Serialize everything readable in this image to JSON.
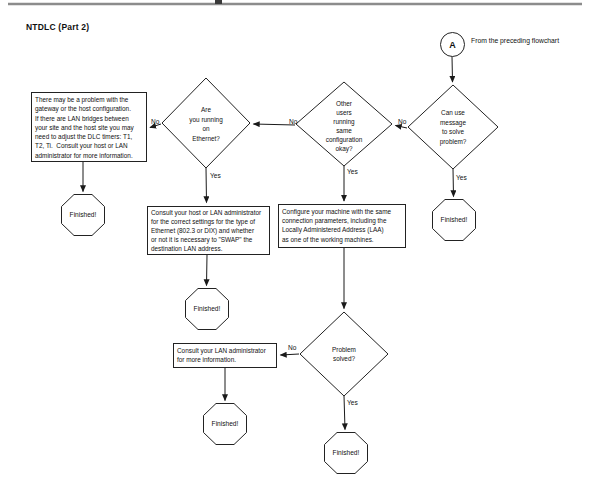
{
  "title": "NTDLC (Part 2)",
  "start": {
    "label": "A",
    "caption": "From the preceding flowchart"
  },
  "decisions": {
    "ethernet": {
      "text": "Are\nyou running\non\nEthernet?",
      "yes": "Yes",
      "no": "No"
    },
    "other_users": {
      "text": "Other\nusers\nrunning\nsame\nconfiguration\nokay?",
      "yes": "Yes",
      "no": "No"
    },
    "can_use_message": {
      "text": "Can use\nmessage\nto solve\nproblem?",
      "yes": "Yes",
      "no": "No"
    },
    "problem_solved": {
      "text": "Problem\nsolved?",
      "yes": "Yes",
      "no": "No"
    }
  },
  "processes": {
    "gateway_problem": {
      "text": "There may be a problem with the\ngateway or the host configuration.\nIf there are LAN bridges between\nyour site and the host site you may\nneed to adjust the DLC timers: T1,\nT2, Ti.  Consult your host or LAN\nadministrator for more information."
    },
    "ethernet_settings": {
      "text": "Consult your host or LAN administrator\nfor the correct settings for the type of\nEthernet (802.3 or DIX) and whether\nor not it is necessary to \"SWAP\" the\ndestination LAN address."
    },
    "configure_laa": {
      "text": "Configure your machine with the same\nconnection parameters, including the\nLocally Administered Address (LAA)\nas one of the working machines."
    },
    "consult_lan": {
      "text": "Consult your LAN administrator\nfor more information."
    }
  },
  "terminator": {
    "label": "Finished!"
  },
  "colors": {
    "line": "#1a1a1a",
    "rule": "#8c8c8c",
    "background": "#ffffff"
  }
}
